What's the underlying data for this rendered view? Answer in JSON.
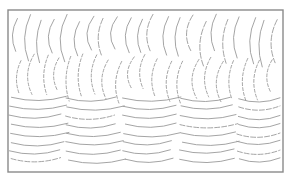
{
  "drawing": {
    "frame": {
      "x": 8,
      "y": 10,
      "width": 275,
      "height": 162,
      "stroke": "#8a8a8a",
      "stroke_width": 1.4
    },
    "line_color": "#9a9a9a",
    "upper_region": {
      "description": "vertical crescent arcs",
      "y_top": 14,
      "y_bottom": 98,
      "columns": 22,
      "x_start": 14,
      "x_step": 12.4,
      "rows": 2,
      "arc_height": 44,
      "bulge": 5
    },
    "lower_region": {
      "description": "horizontal scallop arcs",
      "y_top": 100,
      "y_bottom": 170,
      "columns": 5,
      "x_start": 10,
      "x_step": 57,
      "rows": 8,
      "row_step": 8.8,
      "arc_width": 56,
      "sag": 5
    }
  }
}
